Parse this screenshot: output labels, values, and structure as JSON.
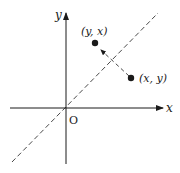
{
  "diagram": {
    "axes": {
      "x_label": "x",
      "y_label": "y",
      "origin_label": "O"
    },
    "mirror_line": {
      "equation": "y = x",
      "style": "dashed"
    },
    "points": [
      {
        "id": "original",
        "label": "(x, y)"
      },
      {
        "id": "reflected",
        "label": "(y, x)"
      }
    ],
    "arrow": {
      "from": "original",
      "to": "reflected",
      "style": "dashed"
    },
    "colors": {
      "ink": "#1a1a1a",
      "background": "#ffffff"
    }
  }
}
